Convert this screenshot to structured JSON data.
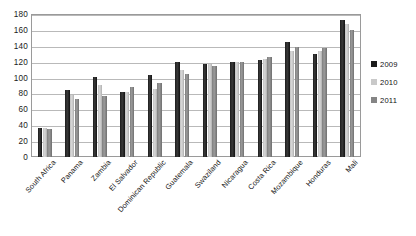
{
  "chart_data": {
    "type": "bar",
    "title": "",
    "xlabel": "",
    "ylabel": "",
    "ylim": [
      0,
      180
    ],
    "ytick_step": 20,
    "yticks": [
      180,
      160,
      140,
      120,
      100,
      80,
      60,
      40,
      20,
      0
    ],
    "grid": true,
    "legend_position": "right",
    "categories": [
      "South Africa",
      "Panama",
      "Zambia",
      "El Salvador",
      "Dominican Republic",
      "Guatemala",
      "Swaziland",
      "Nicaragua",
      "Costa Rica",
      "Mozambique",
      "Honduras",
      "Mali"
    ],
    "series": [
      {
        "name": "2009",
        "color": "#1b1b1b",
        "values": [
          37,
          84,
          101,
          82,
          103,
          120,
          117,
          119,
          122,
          145,
          130,
          172
        ]
      },
      {
        "name": "2010",
        "color": "#c9c9c9",
        "values": [
          37,
          78,
          91,
          82,
          85,
          110,
          117,
          119,
          124,
          133,
          133,
          168
        ]
      },
      {
        "name": "2011",
        "color": "#858585",
        "values": [
          35,
          73,
          77,
          88,
          93,
          104,
          115,
          119,
          126,
          138,
          137,
          160
        ]
      }
    ]
  },
  "legend": {
    "items": [
      {
        "label": "2009",
        "color": "#1b1b1b"
      },
      {
        "label": "2010",
        "color": "#c9c9c9"
      },
      {
        "label": "2011",
        "color": "#858585"
      }
    ]
  }
}
